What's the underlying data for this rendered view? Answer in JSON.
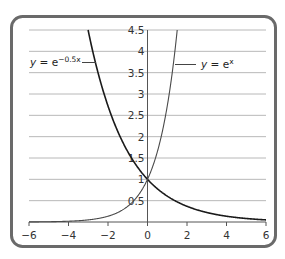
{
  "chart_data": {
    "type": "line",
    "title": "",
    "xlabel": "",
    "ylabel": "",
    "xlim": [
      -6,
      6
    ],
    "ylim": [
      0,
      4.5
    ],
    "grid": {
      "horizontal": true,
      "vertical": false,
      "y_step": 0.5
    },
    "legend": "inline labels with leader lines",
    "x_ticks": [
      -6,
      -4,
      -2,
      0,
      2,
      4,
      6
    ],
    "x_tick_labels": [
      "−6",
      "−4",
      "−2",
      "0",
      "2",
      "4",
      "6"
    ],
    "y_ticks": [
      0.5,
      1,
      1.5,
      2,
      2.5,
      3,
      3.5,
      4,
      4.5
    ],
    "y_tick_labels": [
      "0.5",
      "1",
      "1.5",
      "2",
      "2.5",
      "3",
      "3.5",
      "4",
      "4.5"
    ],
    "series": [
      {
        "name": "y = e^(−0.5x)",
        "label_base": "y = e",
        "label_exp": "−0.5x",
        "function": "exp(-0.5*x)",
        "color": "#1a1a1a",
        "x": [
          -3,
          -2,
          -1,
          0,
          1,
          2,
          3,
          4,
          5,
          6
        ],
        "values": [
          4.48,
          2.72,
          1.65,
          1.0,
          0.61,
          0.37,
          0.22,
          0.14,
          0.08,
          0.05
        ]
      },
      {
        "name": "y = e^x",
        "label_base": "y = e",
        "label_exp": "x",
        "function": "exp(x)",
        "color": "#4a4a4a",
        "x": [
          -6,
          -5,
          -4,
          -3,
          -2,
          -1,
          0,
          1,
          1.5
        ],
        "values": [
          0.0025,
          0.0067,
          0.018,
          0.05,
          0.14,
          0.37,
          1.0,
          2.72,
          4.48
        ]
      }
    ],
    "intersection": {
      "x": 0,
      "y": 1
    }
  },
  "labels": {
    "curve_a": {
      "y": "y",
      "eq": " = e",
      "exp": "−0.5x"
    },
    "curve_b": {
      "y": "y",
      "eq": " = e",
      "exp": "x"
    }
  }
}
